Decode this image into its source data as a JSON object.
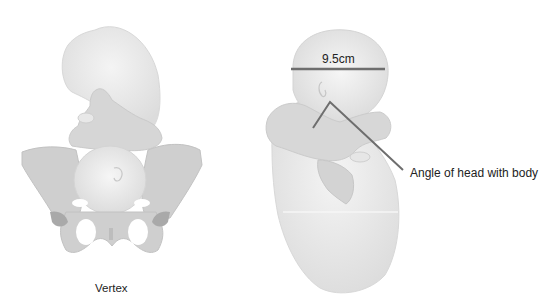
{
  "figure": {
    "left_panel": {
      "caption": "Vertex",
      "description": "Fetus in vertex presentation above the pelvis, viewed from front"
    },
    "right_panel": {
      "measurement_label": "9.5cm",
      "annotation_label": "Angle of head with body",
      "description": "Fetus with flexed head showing biparietal diameter measurement"
    },
    "colors": {
      "fetus_fill": "#e6e6e6",
      "fetus_shadow": "#d2d2d2",
      "pelvis_fill": "#cfcfcf",
      "pelvis_dark": "#aaaaaa",
      "line_color": "#6e6e6e",
      "text_color": "#222222"
    }
  }
}
